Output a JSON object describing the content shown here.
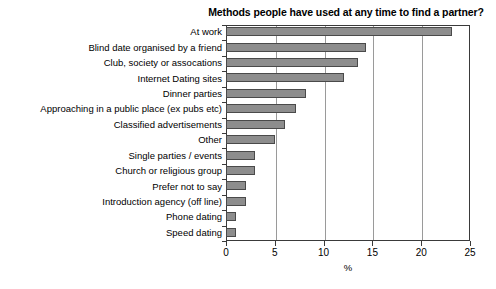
{
  "chart_data": {
    "type": "bar",
    "orientation": "horizontal",
    "title": "Methods people have used at any time to find a partner?",
    "xlabel": "%",
    "ylabel": "",
    "xlim": [
      0,
      25
    ],
    "xticks": [
      0,
      5,
      10,
      15,
      20,
      25
    ],
    "xtick_labels": [
      "0",
      "5",
      "10",
      "15",
      "20",
      "25"
    ],
    "grid": "vertical gridlines at 5, 10, 15, 20",
    "legend": "none",
    "categories": [
      "At work",
      "Blind date organised by a friend",
      "Club, society or assocations",
      "Internet Dating sites",
      "Dinner parties",
      "Approaching in a public place (ex pubs etc)",
      "Classified advertisements",
      "Other",
      "Single parties / events",
      "Church or religious group",
      "Prefer not to say",
      "Introduction agency (off line)",
      "Phone dating",
      "Speed dating"
    ],
    "values": [
      23.2,
      14.3,
      13.5,
      12.1,
      8.2,
      7.2,
      6.0,
      5.0,
      3.0,
      3.0,
      2.0,
      2.0,
      1.0,
      1.0
    ],
    "bar_fill_color": "#8d8d8d",
    "bar_edge_color": "#4a4a4a",
    "background_color": "#ffffff",
    "axis_color": "#3a3a3a",
    "gridline_color": "#9a9a9a"
  }
}
